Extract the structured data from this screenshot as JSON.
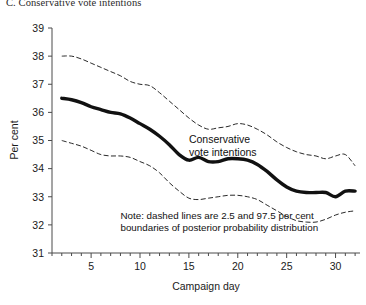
{
  "panel": {
    "title": "C. Conservative vote intentions"
  },
  "chart_data": {
    "type": "line",
    "title": "C. Conservative vote intentions",
    "xlabel": "Campaign day",
    "ylabel": "Per cent",
    "xlim": [
      1,
      32.5
    ],
    "ylim": [
      31,
      39
    ],
    "xticks_major": [
      5,
      10,
      15,
      20,
      25,
      30
    ],
    "xtick_labels": [
      "5",
      "10",
      "15",
      "20",
      "25",
      "30"
    ],
    "xticks_minor_step": 1,
    "yticks": [
      31,
      32,
      33,
      34,
      35,
      36,
      37,
      38,
      39
    ],
    "ytick_labels": [
      "31",
      "32",
      "33",
      "34",
      "35",
      "36",
      "37",
      "38",
      "39"
    ],
    "grid": false,
    "legend": "none",
    "x": [
      2,
      3,
      4,
      5,
      6,
      7,
      8,
      9,
      10,
      11,
      12,
      13,
      14,
      15,
      16,
      17,
      18,
      19,
      20,
      21,
      22,
      23,
      24,
      25,
      26,
      27,
      28,
      29,
      30,
      31,
      32
    ],
    "series": [
      {
        "name": "97.5 per cent boundary",
        "style": "dashed",
        "values": [
          38.0,
          38.0,
          37.9,
          37.75,
          37.6,
          37.45,
          37.3,
          37.1,
          37.0,
          36.95,
          36.7,
          36.4,
          36.1,
          35.8,
          35.55,
          35.4,
          35.45,
          35.5,
          35.6,
          35.55,
          35.4,
          35.2,
          34.95,
          34.75,
          34.6,
          34.5,
          34.45,
          34.35,
          34.45,
          34.5,
          34.1
        ]
      },
      {
        "name": "Conservative vote intentions",
        "style": "solid-thick",
        "values": [
          36.5,
          36.45,
          36.35,
          36.2,
          36.1,
          36.0,
          35.95,
          35.8,
          35.6,
          35.4,
          35.15,
          34.85,
          34.5,
          34.3,
          34.4,
          34.25,
          34.25,
          34.35,
          34.35,
          34.3,
          34.15,
          33.9,
          33.6,
          33.35,
          33.2,
          33.15,
          33.15,
          33.15,
          33.0,
          33.2,
          33.2
        ]
      },
      {
        "name": "2.5 per cent boundary",
        "style": "dashed",
        "values": [
          35.0,
          34.9,
          34.8,
          34.65,
          34.5,
          34.45,
          34.45,
          34.4,
          34.25,
          34.1,
          33.85,
          33.5,
          33.2,
          32.95,
          32.9,
          32.95,
          33.0,
          33.05,
          33.05,
          33.0,
          32.9,
          32.7,
          32.5,
          32.3,
          32.15,
          32.1,
          32.1,
          32.2,
          32.35,
          32.45,
          32.5
        ]
      }
    ],
    "annotations": [
      {
        "id": "series-label",
        "lines": [
          "Conservative",
          "vote intentions"
        ],
        "x": 15.0,
        "y": 34.9
      },
      {
        "id": "note",
        "lines": [
          "Note: dashed lines are 2.5 and 97.5 per cent",
          "boundaries of posterior probability distribution"
        ],
        "x": 8.0,
        "y": 32.2
      }
    ]
  },
  "colors": {
    "line": "#111111",
    "axis": "#4a4a4a",
    "background": "#ffffff"
  }
}
